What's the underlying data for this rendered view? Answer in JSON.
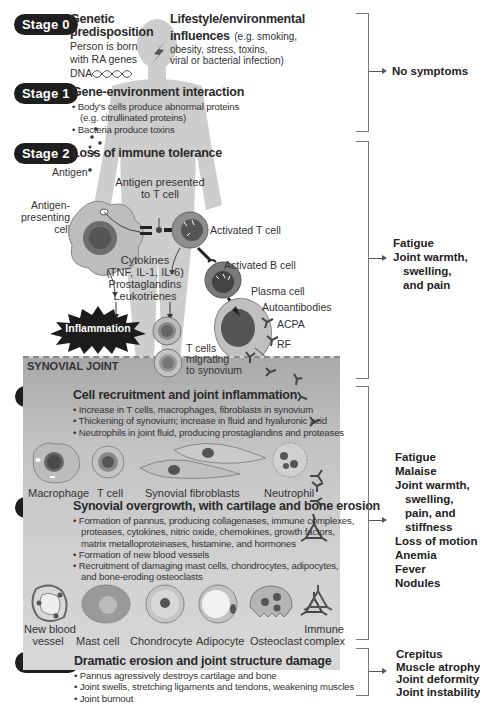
{
  "stages": [
    {
      "id": "stage0",
      "label": "Stage 0"
    },
    {
      "id": "stage1",
      "label": "Stage 1"
    },
    {
      "id": "stage2",
      "label": "Stage 2"
    },
    {
      "id": "stage3",
      "label": "Stage 3"
    },
    {
      "id": "stage4",
      "label": "Stage 4"
    },
    {
      "id": "stage5",
      "label": "Stage 5"
    }
  ],
  "stage0": {
    "genetic_title_1": "Genetic",
    "genetic_title_2": "predisposition",
    "genetic_text_1": "Person is born",
    "genetic_text_2": "with RA genes",
    "dna_label": "DNA",
    "lifestyle_title_1": "Lifestyle/environmental",
    "lifestyle_title_2": "influences",
    "lifestyle_text_1": "(e.g. smoking,",
    "lifestyle_text_2": "obesity, stress, toxins,",
    "lifestyle_text_3": "viral or bacterial infection)"
  },
  "stage1": {
    "title": "Gene-environment interaction",
    "bullets": [
      "• Body's cells produce abnormal proteins",
      "(e.g. citrullinated proteins)",
      "• Bacteria produce toxins"
    ]
  },
  "stage2": {
    "title": "Loss of immune tolerance",
    "antigen": "Antigen",
    "antigen_presented_1": "Antigen presented",
    "antigen_presented_2": "to T cell",
    "apc_1": "Antigen-",
    "apc_2": "presenting",
    "apc_3": "cell",
    "activated_t": "Activated T cell",
    "activated_b": "Activated B cell",
    "plasma": "Plasma cell",
    "cytokines_1": "Cytokines",
    "cytokines_2": "(TNF, IL-1, IL-6)",
    "cytokines_3": "Prostaglandins",
    "cytokines_4": "Leukotrienes",
    "inflammation": "Inflammation",
    "autoantibodies": "Autoantibodies",
    "acpa": "ACPA",
    "rf": "RF",
    "t_migrating_1": "T cells",
    "t_migrating_2": "migrating",
    "t_migrating_3": "to synovium"
  },
  "synovial_label": "SYNOVIAL JOINT",
  "stage3": {
    "title": "Cell recruitment and joint inflammation",
    "bullets": [
      "• Increase in T cells, macrophages, fibroblasts in synovium",
      "• Thickening of synovium; increase in fluid and hyaluronic acid",
      "• Neutrophils in joint fluid, producing prostaglandins and proteases"
    ],
    "cells": [
      "Macrophage",
      "T cell",
      "Synovial fibroblasts",
      "Neutrophil"
    ]
  },
  "stage4": {
    "title": "Synovial overgrowth, with cartilage and bone erosion",
    "bullets": [
      "• Formation of pannus, producing collagenases, immune complexes,",
      "proteases, cytokines, nitric oxide, chemokines, growth factors,",
      "matrix metalloproteinases, histamine, and hormones",
      "• Formation of new blood vessels",
      "• Recruitment of damaging mast cells, chondrocytes, adipocytes,",
      "and bone-eroding osteoclasts"
    ],
    "cells": [
      {
        "l1": "New blood",
        "l2": "vessel"
      },
      {
        "l1": "",
        "l2": "Mast cell"
      },
      {
        "l1": "",
        "l2": "Chondrocyte"
      },
      {
        "l1": "",
        "l2": "Adipocyte"
      },
      {
        "l1": "",
        "l2": "Osteoclast"
      },
      {
        "l1": "Immune",
        "l2": "complex"
      }
    ]
  },
  "stage5": {
    "title": "Dramatic erosion and joint structure damage",
    "bullets": [
      "• Pannus agressively destroys cartilage and bone",
      "• Joint swells, stretching ligaments and tendons, weakening muscles",
      "• Joint burnout"
    ]
  },
  "symptoms": {
    "group1": [
      "No symptoms"
    ],
    "group2": [
      "Fatigue",
      "Joint warmth,",
      "swelling,",
      "and pain"
    ],
    "group3": [
      "Fatigue",
      "Malaise",
      "Joint warmth,",
      "swelling,",
      "pain, and",
      "stiffness",
      "Loss of motion",
      "Anemia",
      "Fever",
      "Nodules"
    ],
    "group4": [
      "Crepitus",
      "Muscle atrophy",
      "Joint deformity",
      "Joint instability"
    ]
  },
  "colors": {
    "pill": "#1e1e1e",
    "silhouette": "#c9c9c9",
    "synovial_top": "#a9a9a9",
    "synovial_bottom": "#d8d8d8",
    "bracket": "#777777"
  }
}
